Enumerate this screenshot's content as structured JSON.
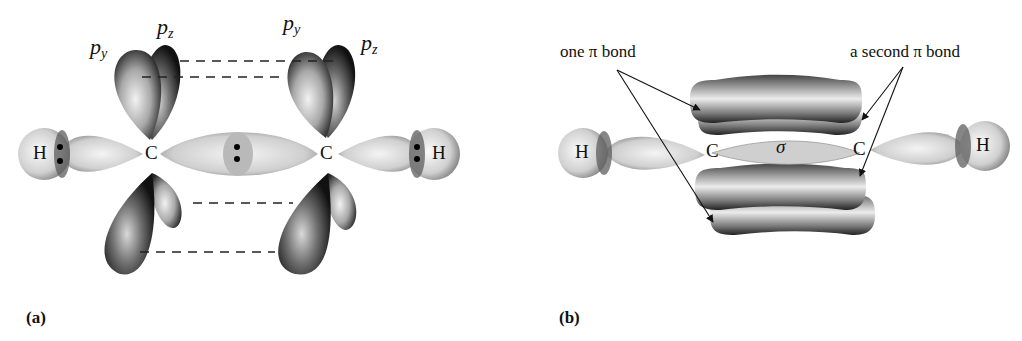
{
  "figure": {
    "panel_a": {
      "caption": "(a)",
      "orbital_labels": [
        {
          "base": "p",
          "sub": "y"
        },
        {
          "base": "p",
          "sub": "z"
        },
        {
          "base": "p",
          "sub": "y"
        },
        {
          "base": "p",
          "sub": "z"
        }
      ],
      "atoms": [
        "H",
        "C",
        "C",
        "H"
      ],
      "description": "sp hybrid orbitals forming C–H and C–C sigma bonds with unhybridized p_y and p_z orbitals aligned for overlap (dashed lines)"
    },
    "panel_b": {
      "caption": "(b)",
      "atoms": [
        "H",
        "C",
        "C",
        "H"
      ],
      "sigma_label": "σ",
      "annotation_left": "one π bond",
      "annotation_right": "a second π bond",
      "description": "Triple bond: one sigma bond plus two perpendicular pi bonds"
    },
    "colors": {
      "background": "#ffffff",
      "ink": "#111111",
      "lobe_dark": "#2a2a2a",
      "lobe_light": "#e6e6e6"
    }
  }
}
